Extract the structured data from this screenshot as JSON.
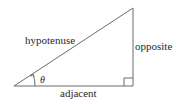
{
  "diagram": {
    "type": "right-triangle",
    "labels": {
      "hypotenuse": "hypotenuse",
      "opposite": "opposite",
      "adjacent": "adjacent",
      "angle": "θ"
    },
    "colors": {
      "line": "#6a6a6a",
      "text": "#2a2a2a",
      "background": "#ffffff"
    }
  }
}
